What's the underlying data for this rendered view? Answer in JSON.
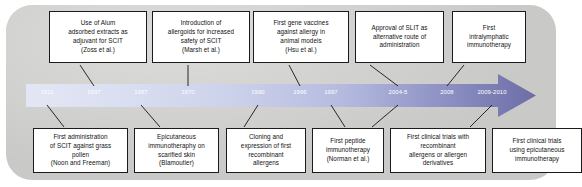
{
  "figure": {
    "panel_color": "#c9c9c7",
    "arrow_start_color": "#dfe2f2",
    "arrow_end_color": "#6f6faa",
    "box_border_color": "#1b1b1b",
    "year_label_color": "#ffffff"
  },
  "timeline": {
    "years": [
      {
        "label": "1911",
        "x": 47
      },
      {
        "label": "1937",
        "x": 94
      },
      {
        "label": "1957",
        "x": 141
      },
      {
        "label": "1970",
        "x": 188
      },
      {
        "label": "1990",
        "x": 258
      },
      {
        "label": "1996",
        "x": 300
      },
      {
        "label": "1997",
        "x": 331
      },
      {
        "label": "2004-5",
        "x": 398
      },
      {
        "label": "2008",
        "x": 447
      },
      {
        "label": "2009-2010",
        "x": 492
      }
    ]
  },
  "events_above": [
    {
      "id": "alum-adsorbed-extracts",
      "lines": [
        "Use of Alum",
        "adsorbed extracts as",
        "adjuvant for SCIT",
        "(Zoss et al.)"
      ],
      "year": "1937"
    },
    {
      "id": "allergoids",
      "lines": [
        "Introduction of",
        "allergoids for increased",
        "safety of SCIT",
        "(Marsh et al.)"
      ],
      "year": "1970"
    },
    {
      "id": "gene-vaccines",
      "lines": [
        "First gene vaccines",
        "against allergy in",
        "animal models",
        "(Hsu et al.)"
      ],
      "year": "1996"
    },
    {
      "id": "slit-approval",
      "lines": [
        "Approval of SLIT as",
        "alternative route of",
        "administration"
      ],
      "year": "2004-5"
    },
    {
      "id": "intralymphatic",
      "lines": [
        "First",
        "intralymphatic",
        "immunotherapy"
      ],
      "year": "2008"
    }
  ],
  "events_below": [
    {
      "id": "first-scit-grass-pollen",
      "lines": [
        "First administration",
        "of SCIT against grass",
        "pollen",
        "(Noon and Freeman)"
      ],
      "year": "1911"
    },
    {
      "id": "epicutaneous-scarified",
      "lines": [
        "Epicutaneous",
        "immunotheraphy on",
        "scarified skin",
        "(Blamoutier)"
      ],
      "year": "1957"
    },
    {
      "id": "cloning-recombinant",
      "lines": [
        "Cloning and",
        "expression of first",
        "recombinant",
        "allergens"
      ],
      "year": "1990"
    },
    {
      "id": "peptide-immunotherapy",
      "lines": [
        "First peptide",
        "immunotherapy",
        "(Norman et al.)"
      ],
      "year": "1997"
    },
    {
      "id": "trials-recombinant",
      "lines": [
        "First clinical trials with",
        "recombinant",
        "allergens or allergen",
        "derivatives"
      ],
      "year": "2004-5"
    },
    {
      "id": "trials-epicutaneous",
      "lines": [
        "First clinical trials",
        "using epicutaneous",
        "immunotherapy"
      ],
      "year": "2009-2010"
    }
  ]
}
